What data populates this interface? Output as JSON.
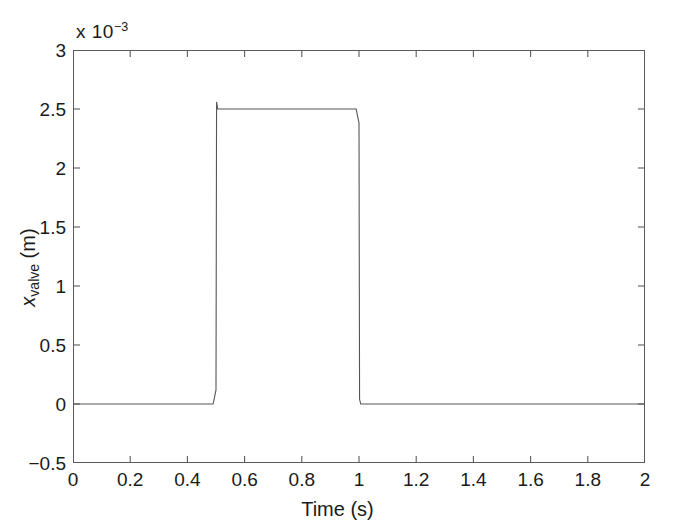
{
  "chart_data": {
    "type": "line",
    "title": "",
    "xlabel": "Time (s)",
    "ylabel": "x_valve (m)",
    "ylabel_base": "x",
    "ylabel_sub": "valve",
    "ylabel_unit": " (m)",
    "exponent_prefix": "x 10",
    "exponent_power": "−3",
    "y_scale_factor": 0.001,
    "xlim": [
      0,
      2
    ],
    "ylim": [
      -0.5,
      3
    ],
    "xticks": [
      0,
      0.2,
      0.4,
      0.6,
      0.8,
      1,
      1.2,
      1.4,
      1.6,
      1.8,
      2
    ],
    "xtick_labels": [
      "0",
      "0.2",
      "0.4",
      "0.6",
      "0.8",
      "1",
      "1.2",
      "1.4",
      "1.6",
      "1.8",
      "2"
    ],
    "yticks": [
      -0.5,
      0,
      0.5,
      1,
      1.5,
      2,
      2.5,
      3
    ],
    "ytick_labels": [
      "−0.5",
      "0",
      "0.5",
      "1",
      "1.5",
      "2",
      "2.5",
      "3"
    ],
    "grid": false,
    "legend": null,
    "line_color": "#555555",
    "line_width": 1.1,
    "series": [
      {
        "name": "x_valve",
        "x": [
          0,
          0.1,
          0.2,
          0.3,
          0.4,
          0.49,
          0.5,
          0.502,
          0.506,
          0.51,
          0.52,
          0.6,
          0.7,
          0.8,
          0.9,
          0.99,
          1.0,
          1.002,
          1.006,
          1.01,
          1.05,
          1.1,
          1.2,
          1.4,
          1.6,
          1.8,
          2.0
        ],
        "y": [
          0,
          0,
          0,
          0,
          0,
          0,
          0.12,
          2.56,
          2.5,
          2.5,
          2.5,
          2.5,
          2.5,
          2.5,
          2.5,
          2.5,
          2.38,
          0.04,
          0,
          0,
          0,
          0,
          0,
          0,
          0,
          0,
          0
        ]
      }
    ]
  }
}
